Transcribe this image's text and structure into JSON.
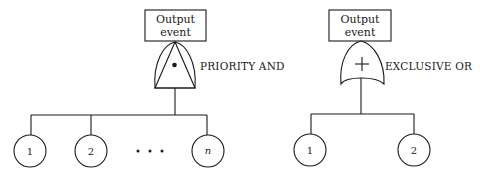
{
  "diagram": {
    "type": "fault-tree-gate-symbols",
    "colors": {
      "stroke": "#1a1a1a",
      "background": "#ffffff"
    },
    "priority_and": {
      "output_box": {
        "line1": "Output",
        "line2": "event"
      },
      "gate_label": "PRIORITY AND",
      "gate_symbol": "priority-and-gate",
      "inner_mark": "dot",
      "inputs": [
        {
          "label": "1"
        },
        {
          "label": "2"
        },
        {
          "label": "n"
        }
      ],
      "ellipsis": "• • •"
    },
    "exclusive_or": {
      "output_box": {
        "line1": "Output",
        "line2": "event"
      },
      "gate_label": "EXCLUSIVE OR",
      "gate_symbol": "exclusive-or-gate",
      "inner_mark": "+",
      "inputs": [
        {
          "label": "1"
        },
        {
          "label": "2"
        }
      ]
    }
  }
}
